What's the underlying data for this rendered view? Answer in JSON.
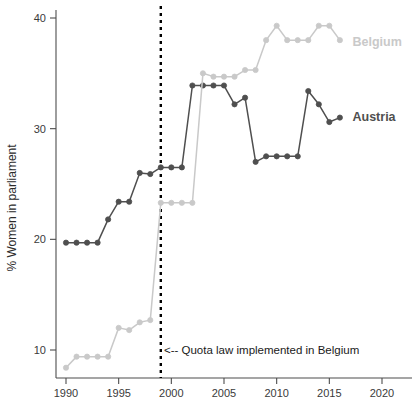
{
  "chart_data": {
    "type": "line",
    "title": "",
    "xlabel": "",
    "ylabel": "% Women in parliament",
    "xlim": [
      1988.5,
      2022.5
    ],
    "ylim": [
      8.0,
      40.8
    ],
    "grid": false,
    "legend_position": "inline-right",
    "x_ticks": [
      1990,
      1995,
      2000,
      2005,
      2010,
      2015,
      2020
    ],
    "y_ticks": [
      10,
      20,
      30,
      40
    ],
    "annotations": [
      {
        "name": "quota-law-annotation",
        "text": "<-- Quota law implemented in Belgium",
        "x": 1999.3,
        "y": 9.9
      }
    ],
    "vlines": [
      {
        "name": "quota-law-vline",
        "x": 1999,
        "style": "dotted",
        "color": "#000000"
      }
    ],
    "series": [
      {
        "name": "Austria",
        "color": "#4f4f4f",
        "label_x": 2017.2,
        "label_y": 31.0,
        "x": [
          1990,
          1991,
          1992,
          1993,
          1994,
          1995,
          1996,
          1997,
          1998,
          1999,
          2000,
          2001,
          2002,
          2003,
          2004,
          2005,
          2006,
          2007,
          2008,
          2009,
          2010,
          2011,
          2012,
          2013,
          2014,
          2015,
          2016
        ],
        "values": [
          19.7,
          19.7,
          19.7,
          19.7,
          21.8,
          23.4,
          23.4,
          26.0,
          25.9,
          26.5,
          26.5,
          26.5,
          33.9,
          33.9,
          33.9,
          33.9,
          32.2,
          32.8,
          27.0,
          27.5,
          27.5,
          27.5,
          27.5,
          33.4,
          32.2,
          30.6,
          31.0
        ]
      },
      {
        "name": "Belgium",
        "color": "#c9c9c9",
        "label_x": 2017.2,
        "label_y": 37.8,
        "x": [
          1990,
          1991,
          1992,
          1993,
          1994,
          1995,
          1996,
          1997,
          1998,
          1999,
          2000,
          2001,
          2002,
          2003,
          2004,
          2005,
          2006,
          2007,
          2008,
          2009,
          2010,
          2011,
          2012,
          2013,
          2014,
          2015,
          2016
        ],
        "values": [
          8.4,
          9.4,
          9.4,
          9.4,
          9.4,
          12.0,
          11.8,
          12.5,
          12.7,
          23.3,
          23.3,
          23.3,
          23.3,
          35.0,
          34.7,
          34.7,
          34.7,
          35.3,
          35.3,
          38.0,
          39.3,
          38.0,
          38.0,
          38.0,
          39.3,
          39.3,
          38.0
        ]
      }
    ]
  },
  "axes": {
    "y_axis_title": "% Women in parliament",
    "y_tick_labels": [
      "10",
      "20",
      "30",
      "40"
    ],
    "x_tick_labels": [
      "1990",
      "1995",
      "2000",
      "2005",
      "2010",
      "2015",
      "2020"
    ]
  },
  "labels": {
    "austria": "Austria",
    "belgium": "Belgium",
    "annotation": "<-- Quota law implemented in Belgium"
  },
  "colors": {
    "austria": "#4f4f4f",
    "belgium": "#c9c9c9",
    "axis": "#4d4d4d",
    "vline": "#000000",
    "background": "#ffffff"
  }
}
